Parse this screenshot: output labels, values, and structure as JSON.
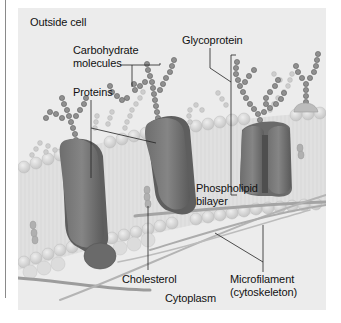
{
  "diagram": {
    "regions": {
      "outside": "Outside cell",
      "inside": "Cytoplasm"
    },
    "labels": {
      "carbohydrate_line1": "Carbohydrate",
      "carbohydrate_line2": "molecules",
      "proteins": "Proteins",
      "glycoprotein": "Glycoprotein",
      "phospholipid_line1": "Phospholipid",
      "phospholipid_line2": "bilayer",
      "cholesterol": "Cholesterol",
      "microfilament_line1": "Microfilament",
      "microfilament_line2": "(cytoskeleton)"
    },
    "colors": {
      "background": "#ececec",
      "protein": "#7a7a7a",
      "protein_dark": "#5e5e5e",
      "chain_dark": "#8d8d8d",
      "chain_light": "#c8c8c8",
      "lipid_head": "#d6d6d6",
      "filament": "#9a9a9a",
      "leader_line": "#222222"
    }
  }
}
